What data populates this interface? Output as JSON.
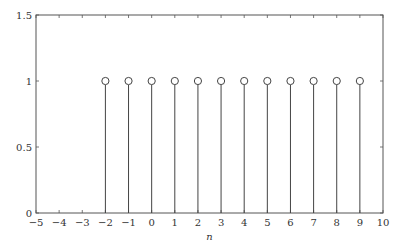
{
  "chart_data": {
    "type": "stem",
    "title": "",
    "xlabel": "n",
    "ylabel": "",
    "xlim": [
      -5,
      10
    ],
    "ylim": [
      0,
      1.5
    ],
    "xticks": [
      -5,
      -4,
      -3,
      -2,
      -1,
      0,
      1,
      2,
      3,
      4,
      5,
      6,
      7,
      8,
      9,
      10
    ],
    "yticks": [
      0,
      0.5,
      1,
      1.5
    ],
    "xtick_labels": [
      "−5",
      "−4",
      "−3",
      "−2",
      "−1",
      "0",
      "1",
      "2",
      "3",
      "4",
      "5",
      "6",
      "7",
      "8",
      "9",
      "10"
    ],
    "ytick_labels": [
      "0",
      "0.5",
      "1",
      "1.5"
    ],
    "grid": false,
    "marker": "circle-open",
    "x": [
      -2,
      -1,
      0,
      1,
      2,
      3,
      4,
      5,
      6,
      7,
      8,
      9
    ],
    "values": [
      1,
      1,
      1,
      1,
      1,
      1,
      1,
      1,
      1,
      1,
      1,
      1
    ]
  },
  "colors": {
    "axis": "#555555",
    "stem": "#444444"
  }
}
